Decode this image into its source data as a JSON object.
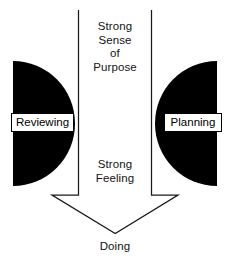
{
  "diagram": {
    "title_text_blocks": {
      "purpose": "Strong\nSense\nof\nPurpose",
      "feeling": "Strong\nFeeling",
      "doing": "Doing"
    },
    "nodes": {
      "left_label": "Reviewing",
      "right_label": "Planning"
    },
    "colors": {
      "background": "#ffffff",
      "shape_fill": "#000000",
      "stroke": "#1a1a1a",
      "label_text": "#000000",
      "body_text": "#141414"
    }
  }
}
